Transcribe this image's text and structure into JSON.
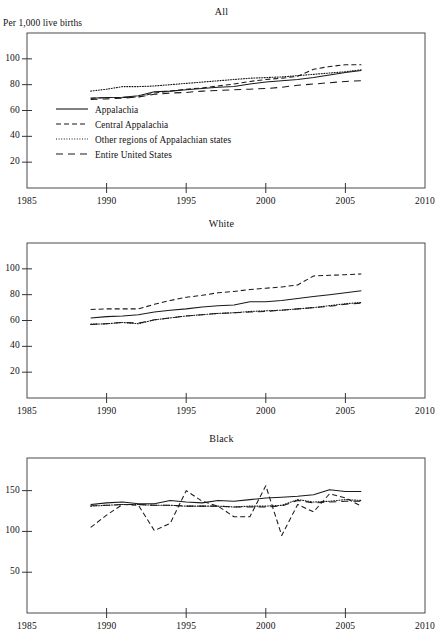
{
  "figure": {
    "clipped_header_fragment": "",
    "y_axis_label": "Per 1,000 live births",
    "x_axis_ticks": [
      "1985",
      "1990",
      "1995",
      "2000",
      "2005",
      "2010"
    ]
  },
  "legend": {
    "items": [
      {
        "label": "Appalachia",
        "style": "solid"
      },
      {
        "label": "Central Appalachia",
        "style": "dashed"
      },
      {
        "label": "Other regions of Appalachian states",
        "style": "dotted"
      },
      {
        "label": "Entire United States",
        "style": "longdash"
      }
    ]
  },
  "chart_data": [
    {
      "type": "line",
      "title": "All",
      "xlabel": "",
      "ylabel": "Per 1,000 live births",
      "xlim": [
        1985,
        2010
      ],
      "ylim": [
        0,
        120
      ],
      "xticks": [
        1985,
        1990,
        1995,
        2000,
        2005,
        2010
      ],
      "yticks": [
        20,
        40,
        60,
        80,
        100
      ],
      "grid": false,
      "legend_position": "inside-lower-left",
      "x": [
        1989,
        1990,
        1991,
        1992,
        1993,
        1994,
        1995,
        1996,
        1997,
        1998,
        1999,
        2000,
        2001,
        2002,
        2003,
        2004,
        2005,
        2006
      ],
      "series": [
        {
          "name": "Appalachia",
          "style": "solid",
          "values": [
            69.5,
            70.0,
            70.3,
            71.5,
            74.5,
            75.0,
            76.0,
            77.0,
            78.0,
            78.5,
            80.5,
            82.0,
            83.0,
            84.0,
            85.5,
            87.5,
            89.5,
            91.0
          ]
        },
        {
          "name": "Central Appalachia",
          "style": "dashed",
          "values": [
            69.5,
            70.0,
            70.0,
            70.5,
            73.5,
            75.0,
            76.5,
            77.5,
            79.0,
            80.5,
            82.5,
            84.0,
            85.0,
            86.5,
            92.0,
            94.0,
            95.5,
            95.5
          ]
        },
        {
          "name": "Other regions of Appalachian states",
          "style": "dotted",
          "values": [
            75.0,
            76.5,
            78.5,
            78.5,
            79.0,
            80.0,
            81.0,
            82.0,
            83.0,
            84.0,
            85.0,
            85.5,
            86.0,
            87.0,
            88.0,
            89.0,
            90.0,
            91.5
          ]
        },
        {
          "name": "Entire United States",
          "style": "longdash",
          "values": [
            68.5,
            69.0,
            69.5,
            70.5,
            72.5,
            73.5,
            74.0,
            75.0,
            75.5,
            76.0,
            76.5,
            77.0,
            78.0,
            79.5,
            80.5,
            81.5,
            82.5,
            83.0
          ]
        }
      ]
    },
    {
      "type": "line",
      "title": "White",
      "xlabel": "",
      "ylabel": "",
      "xlim": [
        1985,
        2010
      ],
      "ylim": [
        0,
        120
      ],
      "xticks": [
        1985,
        1990,
        1995,
        2000,
        2005,
        2010
      ],
      "yticks": [
        20,
        40,
        60,
        80,
        100
      ],
      "grid": false,
      "legend_position": "none",
      "x": [
        1989,
        1990,
        1991,
        1992,
        1993,
        1994,
        1995,
        1996,
        1997,
        1998,
        1999,
        2000,
        2001,
        2002,
        2003,
        2004,
        2005,
        2006
      ],
      "series": [
        {
          "name": "Appalachia",
          "style": "solid",
          "values": [
            62.0,
            63.0,
            63.5,
            64.5,
            66.5,
            68.0,
            69.0,
            70.5,
            71.5,
            72.0,
            74.5,
            74.5,
            75.5,
            77.0,
            78.5,
            80.0,
            81.5,
            83.0
          ]
        },
        {
          "name": "Central Appalachia",
          "style": "dashed",
          "values": [
            68.5,
            69.0,
            69.0,
            69.0,
            72.5,
            75.5,
            78.0,
            79.5,
            81.5,
            82.5,
            84.0,
            85.0,
            86.0,
            87.5,
            94.5,
            95.0,
            95.5,
            96.0
          ]
        },
        {
          "name": "Other regions of Appalachian states",
          "style": "dotted",
          "values": [
            57.0,
            57.5,
            58.5,
            57.5,
            60.5,
            62.0,
            63.5,
            64.5,
            65.5,
            66.0,
            67.0,
            67.5,
            68.0,
            69.0,
            70.0,
            71.5,
            73.0,
            74.0
          ]
        },
        {
          "name": "Entire United States",
          "style": "longdash",
          "values": [
            57.0,
            57.5,
            58.5,
            58.0,
            60.5,
            62.0,
            63.5,
            64.5,
            65.5,
            66.0,
            66.5,
            67.0,
            68.0,
            69.0,
            70.0,
            71.0,
            72.5,
            73.5
          ]
        }
      ]
    },
    {
      "type": "line",
      "title": "Black",
      "xlabel": "",
      "ylabel": "",
      "xlim": [
        1985,
        2010
      ],
      "ylim": [
        0,
        190
      ],
      "xticks": [
        1985,
        1990,
        1995,
        2000,
        2005,
        2010
      ],
      "yticks": [
        50,
        100,
        150
      ],
      "grid": false,
      "legend_position": "none",
      "x": [
        1989,
        1990,
        1991,
        1992,
        1993,
        1994,
        1995,
        1996,
        1997,
        1998,
        1999,
        2000,
        2001,
        2002,
        2003,
        2004,
        2005,
        2006
      ],
      "series": [
        {
          "name": "Appalachia",
          "style": "solid",
          "values": [
            133,
            135,
            136,
            134,
            134,
            138,
            136,
            135,
            138,
            137,
            139,
            141,
            142,
            143,
            145,
            151,
            149,
            149
          ]
        },
        {
          "name": "Central Appalachia",
          "style": "dashed",
          "values": [
            105,
            120,
            133,
            132,
            101,
            110,
            150,
            137,
            131,
            118,
            118,
            156,
            95,
            133,
            124,
            146,
            141,
            131
          ]
        },
        {
          "name": "Other regions of Appalachian states",
          "style": "dotted",
          "values": [
            131,
            132,
            133,
            133,
            132,
            132,
            131,
            131,
            131,
            130,
            131,
            131,
            132,
            139,
            136,
            137,
            139,
            138
          ]
        },
        {
          "name": "Entire United States",
          "style": "longdash",
          "values": [
            132,
            132,
            133,
            133,
            132,
            132,
            131,
            131,
            131,
            130,
            130,
            130,
            131,
            138,
            135,
            136,
            137,
            137
          ]
        }
      ]
    }
  ]
}
